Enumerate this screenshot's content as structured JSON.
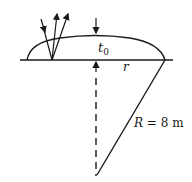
{
  "diagram": {
    "labels": {
      "thickness": "t",
      "thickness_sub": "0",
      "radius_small": "r",
      "radius_big_var": "R",
      "radius_big_rest": " = 8 m"
    },
    "colors": {
      "stroke": "#1a1a1a",
      "background": "#ffffff"
    }
  }
}
